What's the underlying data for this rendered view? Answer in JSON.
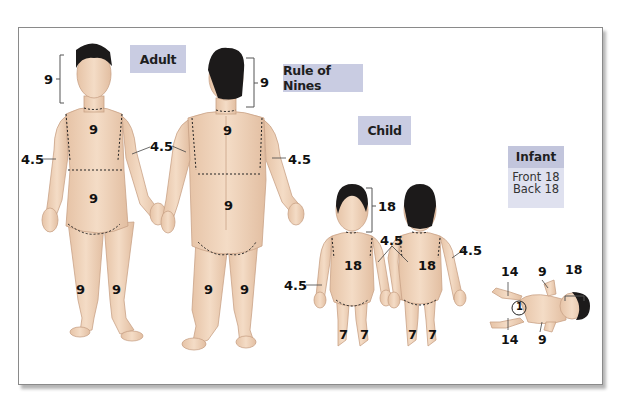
{
  "title": "Rule of Nines",
  "labels": {
    "adult": "Adult",
    "rule_of_nines": "Rule of Nines",
    "child": "Child",
    "infant": "Infant",
    "infant_front": "Front 18",
    "infant_back": "Back 18"
  },
  "adult_front": {
    "head": "9",
    "chest": "9",
    "abdomen": "9",
    "arm_right": "4.5",
    "arm_left": "4.5",
    "leg_right": "9",
    "leg_left": "9"
  },
  "adult_back": {
    "head": "9",
    "upper_back": "9",
    "lower_back": "9",
    "arm": "4.5",
    "leg_left": "9",
    "leg_right": "9"
  },
  "child": {
    "head": "18",
    "arm_shared": "4.5",
    "arm_left": "4.5",
    "arm_right": "4.5",
    "front_trunk": "18",
    "back_trunk": "18",
    "front_leg_left": "7",
    "front_leg_right": "7",
    "back_leg_left": "7",
    "back_leg_right": "7"
  },
  "infant": {
    "leg_top": "14",
    "arm_top": "9",
    "head": "18",
    "genital": "1",
    "leg_bottom": "14",
    "arm_bottom": "9"
  },
  "colors": {
    "label_fill": "#c9cce2",
    "skin": "#f0d6be",
    "skin_shade": "#dcb89c",
    "hair": "#1c1a1a",
    "frame_border": "#8a8a8a"
  }
}
